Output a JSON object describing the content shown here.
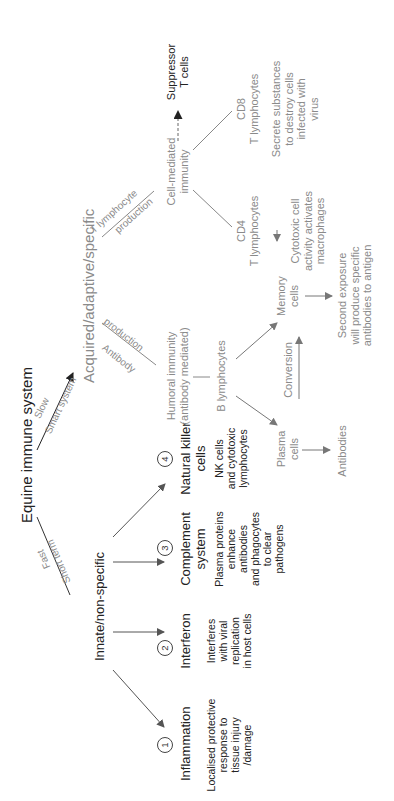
{
  "diagram": {
    "title": "Equine immune system",
    "colors": {
      "primary_text": "#222222",
      "secondary_text": "#8a8a8a",
      "arrow": "#555555"
    },
    "branch_labels": {
      "fast": "Fast",
      "short_term": "Short term",
      "slow": "Slow",
      "smart_system": "Smart system"
    },
    "innate": {
      "label": "Innate/non-specific",
      "items": [
        {
          "num": "1",
          "title": "Inflammation",
          "desc_lines": [
            "Localised protective",
            "response to",
            "tissue injury",
            "/damage"
          ]
        },
        {
          "num": "2",
          "title": "Interferon",
          "desc_lines": [
            "Interferes",
            "with viral",
            "replication",
            "in host cells"
          ]
        },
        {
          "num": "3",
          "title_lines": [
            "Complement",
            "system"
          ],
          "desc_lines": [
            "Plasma proteins",
            "enhance",
            "antibodies",
            "and phagocytes",
            "to clear",
            "pathogens"
          ]
        },
        {
          "num": "4",
          "title_lines": [
            "Natural killer",
            "cells"
          ],
          "desc_lines": [
            "NK cells",
            "and cytotoxic",
            "lymphocytes"
          ]
        }
      ]
    },
    "acquired": {
      "label": "Acquired/adaptive/specific",
      "antibody_branch": {
        "top": "Antibody",
        "bottom": "production"
      },
      "t_branch": {
        "top": "T lymphocyte",
        "bottom": "production"
      },
      "humoral": {
        "lines": [
          "Humoral immunity",
          "(antibody mediated)"
        ],
        "b_lymphocytes": "B lymphocytes",
        "plasma_cells": [
          "Plasma",
          "cells"
        ],
        "antibodies": "Antibodies",
        "conversion": "Conversion",
        "memory_cells": [
          "Memory",
          "cells"
        ],
        "second_exposure": [
          "Second exposure",
          "will produce specific",
          "antibodies to antigen"
        ]
      },
      "cell_mediated": {
        "lines": [
          "Cell-mediated",
          "immunity"
        ],
        "suppressor": [
          "Suppressor",
          "T cells"
        ],
        "cd4": {
          "lines": [
            "CD4",
            "T lymphocytes"
          ],
          "desc_lines": [
            "Cytotoxic cell",
            "activity activates",
            "macrophages"
          ]
        },
        "cd8": {
          "lines": [
            "CD8",
            "T lymphocytes"
          ],
          "desc_lines": [
            "Secrete substances",
            "to destroy cells",
            "infected with",
            "virus"
          ]
        }
      }
    }
  }
}
